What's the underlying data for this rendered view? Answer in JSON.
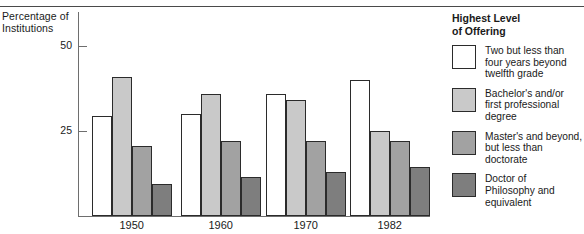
{
  "figure": {
    "y_axis_title": "Percentage of\nInstitutions",
    "legend_title": "Highest Level\nof Offering"
  },
  "chart_data": {
    "type": "bar",
    "title": "",
    "xlabel": "",
    "ylabel": "Percentage of Institutions",
    "categories": [
      "1950",
      "1960",
      "1970",
      "1982"
    ],
    "ylim": [
      0,
      60
    ],
    "yticks": [
      25,
      50
    ],
    "ytick_labels": [
      "25",
      "50"
    ],
    "grid": false,
    "legend_position": "right",
    "series": [
      {
        "name": "Two but less than four years beyond twelfth grade",
        "color": "#ffffff",
        "values": [
          29.5,
          30.0,
          36.0,
          40.0
        ]
      },
      {
        "name": "Bachelor's and/or first professional degree",
        "color": "#c9c9c9",
        "values": [
          41.0,
          36.0,
          34.0,
          25.0
        ]
      },
      {
        "name": "Master's and beyond, but less than doctorate",
        "color": "#a2a2a2",
        "values": [
          20.5,
          22.0,
          22.0,
          22.0
        ]
      },
      {
        "name": "Doctor of Philosophy and equivalent",
        "color": "#7e7e7e",
        "values": [
          9.5,
          11.5,
          13.0,
          14.5
        ]
      }
    ]
  },
  "legend": {
    "items": [
      {
        "label": "Two but less than\nfour years beyond\n twelfth grade",
        "color": "#ffffff"
      },
      {
        "label": "Bachelor's and/or\nfirst professional\ndegree",
        "color": "#c9c9c9"
      },
      {
        "label": "Master's and beyond,\nbut less than\ndoctorate",
        "color": "#a2a2a2"
      },
      {
        "label": "Doctor of\nPhilosophy and\nequivalent",
        "color": "#7e7e7e"
      }
    ]
  }
}
